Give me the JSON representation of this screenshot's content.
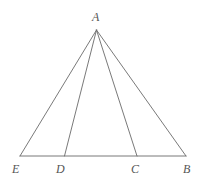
{
  "figure": {
    "kind": "geometry-diagram",
    "width": 203,
    "height": 183,
    "background_color": "#ffffff",
    "stroke_color": "#6a6a6a",
    "stroke_width": 0.9,
    "label_color": "#555555",
    "label_font_size": 12,
    "points": [
      {
        "id": "A",
        "label": "A",
        "x": 96.5,
        "y": 30,
        "label_x": 92,
        "label_y": 11
      },
      {
        "id": "E",
        "label": "E",
        "x": 20,
        "y": 156,
        "label_x": 12,
        "label_y": 163
      },
      {
        "id": "D",
        "label": "D",
        "x": 64.5,
        "y": 156,
        "label_x": 56,
        "label_y": 163
      },
      {
        "id": "C",
        "label": "C",
        "x": 137,
        "y": 156,
        "label_x": 131,
        "label_y": 163
      },
      {
        "id": "B",
        "label": "B",
        "x": 186,
        "y": 156,
        "label_x": 183,
        "label_y": 163
      }
    ],
    "segments": [
      {
        "id": "AE",
        "from": "A",
        "to": "E"
      },
      {
        "id": "AD",
        "from": "A",
        "to": "D"
      },
      {
        "id": "AC",
        "from": "A",
        "to": "C"
      },
      {
        "id": "AB",
        "from": "A",
        "to": "B"
      },
      {
        "id": "EB",
        "from": "E",
        "to": "B"
      }
    ]
  }
}
